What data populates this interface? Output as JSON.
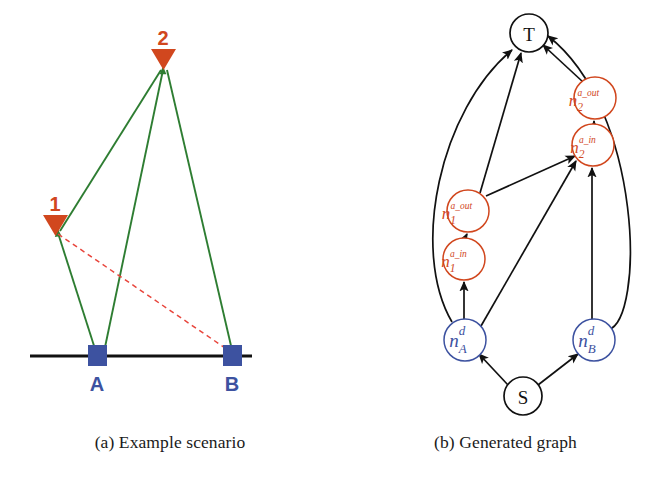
{
  "figure": {
    "panels": [
      {
        "id": "a",
        "caption": "(a) Example scenario",
        "colors": {
          "sensor": "#d1471e",
          "target": "#2a3b9e",
          "visibility_line": "#2e7d32",
          "blocked_line": "#e8453c",
          "ground": "#111111"
        },
        "ground_line": {
          "label": "ground"
        },
        "sensors": [
          {
            "name": "1",
            "label": "1",
            "x": 55,
            "y": 228,
            "kind": "triangle-down-marker"
          },
          {
            "name": "2",
            "label": "2",
            "x": 163,
            "y": 62,
            "kind": "triangle-down-marker"
          }
        ],
        "targets": [
          {
            "name": "A",
            "label": "A",
            "x": 96,
            "y": 356,
            "kind": "square-marker"
          },
          {
            "name": "B",
            "label": "B",
            "x": 231,
            "y": 356,
            "kind": "square-marker"
          }
        ],
        "edges": [
          {
            "from": "A",
            "to": "1",
            "style": "solid",
            "color": "#2e7d32",
            "meaning": "visible"
          },
          {
            "from": "A",
            "to": "2",
            "style": "solid",
            "color": "#2e7d32",
            "meaning": "visible"
          },
          {
            "from": "B",
            "to": "2",
            "style": "solid",
            "color": "#2e7d32",
            "meaning": "visible"
          },
          {
            "from": "1",
            "to": "B",
            "style": "dashed",
            "color": "#e8453c",
            "meaning": "not-visible"
          }
        ]
      },
      {
        "id": "b",
        "caption": "(b) Generated graph",
        "colors": {
          "sensor_node": "#d1471e",
          "demand_node": "#3d52a0",
          "terminal_node": "#111111",
          "edge": "#111111"
        },
        "nodes": [
          {
            "id": "T",
            "label": "T",
            "sub": "",
            "sup": "",
            "x": 189,
            "y": 33,
            "r": 19,
            "color": "#111111",
            "kind": "sink-node"
          },
          {
            "id": "S",
            "label": "S",
            "sub": "",
            "sup": "",
            "x": 183,
            "y": 396,
            "r": 19,
            "color": "#111111",
            "kind": "source-node"
          },
          {
            "id": "n1_in",
            "label": "n",
            "sub": "1",
            "sup": "a_in",
            "x": 124,
            "y": 259,
            "r": 21,
            "color": "#d1471e",
            "kind": "sensor-in-node"
          },
          {
            "id": "n1_out",
            "label": "n",
            "sub": "1",
            "sup": "a_out",
            "x": 128,
            "y": 211,
            "r": 21,
            "color": "#d1471e",
            "kind": "sensor-out-node"
          },
          {
            "id": "n2_in",
            "label": "n",
            "sub": "2",
            "sup": "a_in",
            "x": 253,
            "y": 145,
            "r": 21,
            "color": "#d1471e",
            "kind": "sensor-in-node"
          },
          {
            "id": "n2_out",
            "label": "n",
            "sub": "2",
            "sup": "a_out",
            "x": 255,
            "y": 98,
            "r": 21,
            "color": "#d1471e",
            "kind": "sensor-out-node"
          },
          {
            "id": "nA_d",
            "label": "n",
            "sub": "A",
            "sup": "d",
            "x": 125,
            "y": 340,
            "r": 21,
            "color": "#3d52a0",
            "kind": "demand-node"
          },
          {
            "id": "nB_d",
            "label": "n",
            "sub": "B",
            "sup": "d",
            "x": 254,
            "y": 340,
            "r": 21,
            "color": "#3d52a0",
            "kind": "demand-node"
          }
        ],
        "edges": [
          {
            "from": "S",
            "to": "nA_d",
            "shape": "straight"
          },
          {
            "from": "S",
            "to": "nB_d",
            "shape": "straight"
          },
          {
            "from": "nA_d",
            "to": "n1_in",
            "shape": "straight"
          },
          {
            "from": "n1_in",
            "to": "n1_out",
            "shape": "straight"
          },
          {
            "from": "n1_out",
            "to": "T",
            "shape": "straight"
          },
          {
            "from": "n1_out",
            "to": "n2_in",
            "shape": "straight"
          },
          {
            "from": "nA_d",
            "to": "n2_in",
            "shape": "straight"
          },
          {
            "from": "nA_d",
            "to": "T",
            "shape": "curved-left"
          },
          {
            "from": "nB_d",
            "to": "n2_in",
            "shape": "straight"
          },
          {
            "from": "nB_d",
            "to": "T",
            "shape": "curved-right"
          },
          {
            "from": "n2_in",
            "to": "n2_out",
            "shape": "straight"
          },
          {
            "from": "n2_out",
            "to": "T",
            "shape": "straight"
          }
        ]
      }
    ]
  }
}
